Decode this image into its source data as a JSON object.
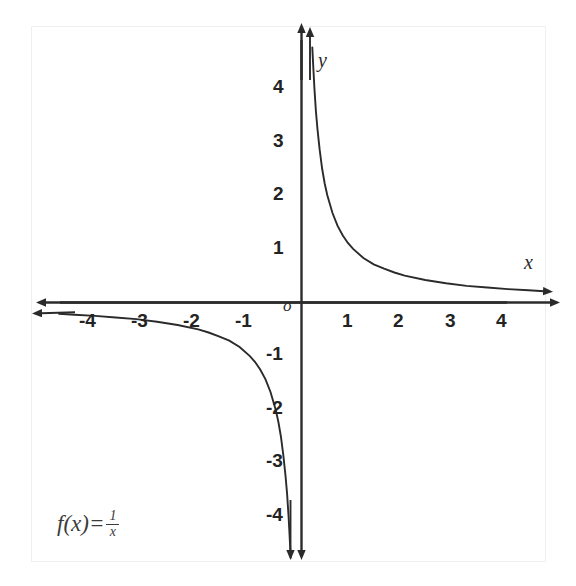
{
  "figure": {
    "kind": "cartesian-graph",
    "background_color": "#ffffff",
    "ink_color": "#2b2b2b"
  },
  "formula": {
    "fx": "f(x)",
    "equals": "=",
    "numerator": "1",
    "denominator": "x"
  },
  "axes": {
    "x_name": "x",
    "y_name": "y",
    "origin_label": "o"
  },
  "chart_data": {
    "type": "line",
    "title": "",
    "subtitle": "",
    "xlabel": "x",
    "ylabel": "y",
    "annotations": [
      "f(x) = 1/x"
    ],
    "legend": [],
    "legend_position": "none",
    "grid": false,
    "xlim": [
      -4.75,
      4.75
    ],
    "ylim": [
      -4.75,
      4.75
    ],
    "x_ticks": [
      -4,
      -3,
      -2,
      -1,
      1,
      2,
      3,
      4
    ],
    "x_tick_labels": [
      "-4",
      "-3",
      "-2",
      "-1",
      "1",
      "2",
      "3",
      "4"
    ],
    "y_ticks": [
      -4,
      -3,
      -2,
      -1,
      1,
      2,
      3,
      4
    ],
    "y_tick_labels": [
      "-4",
      "-3",
      "-2",
      "-1",
      "1",
      "2",
      "3",
      "4"
    ],
    "series": [
      {
        "name": "f(x) = 1/x  (branch x > 0)",
        "x": [
          0.21,
          0.23,
          0.25,
          0.28,
          0.31,
          0.35,
          0.4,
          0.45,
          0.5,
          0.6,
          0.7,
          0.8,
          0.9,
          1.0,
          1.2,
          1.4,
          1.6,
          1.8,
          2.0,
          2.4,
          2.8,
          3.2,
          3.6,
          4.0,
          4.4,
          4.7
        ],
        "y": [
          4.76,
          4.35,
          4.0,
          3.57,
          3.23,
          2.86,
          2.5,
          2.22,
          2.0,
          1.67,
          1.43,
          1.25,
          1.11,
          1.0,
          0.83,
          0.71,
          0.63,
          0.56,
          0.5,
          0.42,
          0.36,
          0.31,
          0.28,
          0.25,
          0.23,
          0.21
        ]
      },
      {
        "name": "f(x) = 1/x  (branch x < 0)",
        "x": [
          -4.7,
          -4.4,
          -4.0,
          -3.6,
          -3.2,
          -2.8,
          -2.4,
          -2.0,
          -1.8,
          -1.6,
          -1.4,
          -1.2,
          -1.0,
          -0.9,
          -0.8,
          -0.7,
          -0.6,
          -0.5,
          -0.45,
          -0.4,
          -0.35,
          -0.31,
          -0.28,
          -0.25,
          -0.23,
          -0.21
        ],
        "y": [
          -0.21,
          -0.23,
          -0.25,
          -0.28,
          -0.31,
          -0.36,
          -0.42,
          -0.5,
          -0.56,
          -0.63,
          -0.71,
          -0.83,
          -1.0,
          -1.11,
          -1.25,
          -1.43,
          -1.67,
          -2.0,
          -2.22,
          -2.5,
          -2.86,
          -3.23,
          -3.57,
          -4.0,
          -4.35,
          -4.76
        ]
      }
    ]
  },
  "x_tick_labels": [
    {
      "text": "-4",
      "left": 79,
      "top": 311
    },
    {
      "text": "-3",
      "left": 131,
      "top": 311
    },
    {
      "text": "-2",
      "left": 183,
      "top": 311
    },
    {
      "text": "-1",
      "left": 235,
      "top": 311
    },
    {
      "text": "1",
      "left": 342,
      "top": 311
    },
    {
      "text": "2",
      "left": 393,
      "top": 311
    },
    {
      "text": "3",
      "left": 445,
      "top": 311
    },
    {
      "text": "4",
      "left": 496,
      "top": 311
    }
  ],
  "y_tick_labels": [
    {
      "text": "4",
      "left": 273,
      "top": 77
    },
    {
      "text": "3",
      "left": 273,
      "top": 131
    },
    {
      "text": "2",
      "left": 273,
      "top": 184
    },
    {
      "text": "1",
      "left": 273,
      "top": 238
    },
    {
      "text": "-1",
      "left": 266,
      "top": 344
    },
    {
      "text": "-2",
      "left": 266,
      "top": 398
    },
    {
      "text": "-3",
      "left": 266,
      "top": 451
    },
    {
      "text": "-4",
      "left": 266,
      "top": 505
    }
  ]
}
